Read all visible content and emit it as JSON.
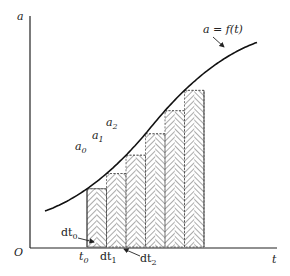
{
  "figure": {
    "type": "riemann-sum-diagram",
    "curve_label": "a = f(t)",
    "axes": {
      "y_label": "a",
      "x_label": "t",
      "origin_label": "O"
    },
    "value_labels": [
      {
        "base": "a",
        "sub": "0"
      },
      {
        "base": "a",
        "sub": "1"
      },
      {
        "base": "a",
        "sub": "2"
      }
    ],
    "t_labels": {
      "t0": {
        "base": "t",
        "sub": "0"
      },
      "dt0": {
        "base": "dt",
        "sub": "0"
      },
      "dt1": {
        "base": "dt",
        "sub": "1"
      },
      "dt2": {
        "base": "dt",
        "sub": "2"
      }
    },
    "strip_count": 6,
    "colors": {
      "line": "#222222",
      "hatch": "#444444",
      "background": "#ffffff"
    }
  }
}
